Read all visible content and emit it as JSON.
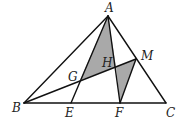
{
  "diagram": {
    "type": "geometry",
    "colors": {
      "stroke": "#111111",
      "shade": "#a9a9a9",
      "background": "#ffffff"
    },
    "points": {
      "A": {
        "label": "A",
        "x": 108,
        "y": 16
      },
      "B": {
        "label": "B",
        "x": 24,
        "y": 103
      },
      "C": {
        "label": "C",
        "x": 166,
        "y": 103
      },
      "E": {
        "label": "E",
        "x": 71,
        "y": 103
      },
      "F": {
        "label": "F",
        "x": 120,
        "y": 103
      },
      "M": {
        "label": "M",
        "x": 136,
        "y": 59
      },
      "G": {
        "label": "G",
        "x": 80,
        "y": 80
      },
      "H": {
        "label": "H",
        "x": 116,
        "y": 67
      }
    },
    "segments": [
      [
        "A",
        "B"
      ],
      [
        "A",
        "C"
      ],
      [
        "B",
        "C"
      ],
      [
        "A",
        "E"
      ],
      [
        "A",
        "F"
      ],
      [
        "B",
        "M"
      ],
      [
        "M",
        "F"
      ]
    ],
    "shaded_regions": [
      [
        "A",
        "G",
        "H"
      ],
      [
        "H",
        "M",
        "F"
      ]
    ]
  }
}
